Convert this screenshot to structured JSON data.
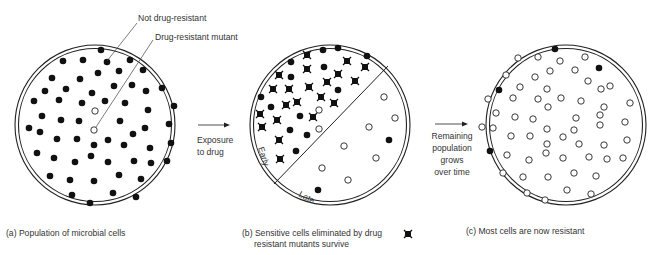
{
  "figure": {
    "callouts": {
      "not_resistant": "Not drug-resistant",
      "resistant_mutant": "Drug-resistant mutant"
    },
    "arrow1_label": [
      "Exposure",
      "to drug"
    ],
    "arrow2_label": [
      "Remaining",
      "population",
      "grows",
      "over time"
    ],
    "zone_labels": {
      "early": "Early",
      "late": "Late"
    },
    "captions": {
      "a": "(a) Population of microbial cells",
      "b_line1": "(b) Sensitive cells eliminated by drug",
      "b_line1_suffix": ";",
      "b_line2": "resistant mutants survive",
      "c": "(c) Most cells are now resistant"
    },
    "legend_icon": "x-marked-cell-icon",
    "colors": {
      "ink": "#111111",
      "line": "#222222",
      "text": "#333333",
      "bg": "#ffffff"
    }
  },
  "panels": {
    "a": {
      "center": [
        95,
        125
      ],
      "r": 80,
      "filled": [
        [
          101,
          50
        ],
        [
          63,
          61
        ],
        [
          83,
          60
        ],
        [
          107,
          62
        ],
        [
          130,
          60
        ],
        [
          52,
          78
        ],
        [
          80,
          79
        ],
        [
          98,
          73
        ],
        [
          119,
          71
        ],
        [
          143,
          70
        ],
        [
          45,
          91
        ],
        [
          66,
          89
        ],
        [
          92,
          93
        ],
        [
          114,
          86
        ],
        [
          132,
          85
        ],
        [
          146,
          91
        ],
        [
          162,
          88
        ],
        [
          34,
          101
        ],
        [
          59,
          100
        ],
        [
          82,
          103
        ],
        [
          105,
          101
        ],
        [
          125,
          103
        ],
        [
          174,
          106
        ],
        [
          42,
          116
        ],
        [
          61,
          120
        ],
        [
          79,
          121
        ],
        [
          148,
          110
        ],
        [
          120,
          121
        ],
        [
          29,
          128
        ],
        [
          40,
          132
        ],
        [
          145,
          128
        ],
        [
          169,
          124
        ],
        [
          57,
          139
        ],
        [
          77,
          139
        ],
        [
          94,
          145
        ],
        [
          108,
          140
        ],
        [
          124,
          145
        ],
        [
          133,
          134
        ],
        [
          150,
          148
        ],
        [
          171,
          143
        ],
        [
          37,
          153
        ],
        [
          54,
          158
        ],
        [
          75,
          162
        ],
        [
          91,
          156
        ],
        [
          108,
          162
        ],
        [
          134,
          161
        ],
        [
          151,
          163
        ],
        [
          167,
          161
        ],
        [
          50,
          176
        ],
        [
          70,
          180
        ],
        [
          94,
          181
        ],
        [
          119,
          175
        ],
        [
          141,
          179
        ],
        [
          72,
          195
        ],
        [
          90,
          203
        ],
        [
          113,
          193
        ],
        [
          136,
          197
        ]
      ],
      "hollow": [
        [
          95,
          111
        ],
        [
          94,
          130
        ]
      ]
    },
    "b": {
      "center": [
        330,
        125
      ],
      "r": 80,
      "divider": [
        [
          388,
          66
        ],
        [
          274,
          184
        ]
      ],
      "killed": [
        [
          307,
          55
        ],
        [
          347,
          61
        ],
        [
          365,
          67
        ],
        [
          307,
          69
        ],
        [
          338,
          74
        ],
        [
          279,
          75
        ],
        [
          327,
          82
        ],
        [
          355,
          81
        ],
        [
          273,
          89
        ],
        [
          289,
          89
        ],
        [
          309,
          87
        ],
        [
          321,
          97
        ],
        [
          297,
          102
        ],
        [
          286,
          105
        ],
        [
          334,
          103
        ],
        [
          260,
          114
        ],
        [
          277,
          120
        ],
        [
          313,
          117
        ],
        [
          262,
          127
        ],
        [
          279,
          140
        ],
        [
          280,
          159
        ]
      ],
      "filled": [
        [
          323,
          50
        ],
        [
          338,
          48
        ],
        [
          367,
          56
        ],
        [
          291,
          62
        ],
        [
          324,
          67
        ],
        [
          291,
          77
        ],
        [
          338,
          90
        ],
        [
          261,
          97
        ],
        [
          271,
          107
        ],
        [
          300,
          116
        ],
        [
          290,
          130
        ],
        [
          307,
          135
        ],
        [
          296,
          151
        ],
        [
          389,
          140
        ],
        [
          318,
          190
        ]
      ],
      "hollow": [
        [
          319,
          110
        ],
        [
          319,
          129
        ],
        [
          384,
          97
        ],
        [
          395,
          118
        ],
        [
          369,
          127
        ],
        [
          344,
          146
        ],
        [
          376,
          158
        ],
        [
          322,
          168
        ],
        [
          348,
          180
        ]
      ],
      "early_pos": [
        258,
        148,
        72
      ],
      "late_pos": [
        298,
        196,
        28
      ]
    },
    "c": {
      "center": [
        566,
        125
      ],
      "r": 80,
      "filled": [
        [
          555,
          49
        ],
        [
          599,
          68
        ],
        [
          499,
          90
        ],
        [
          490,
          151
        ]
      ],
      "hollow": [
        [
          518,
          58
        ],
        [
          538,
          57
        ],
        [
          585,
          57
        ],
        [
          560,
          61
        ],
        [
          506,
          75
        ],
        [
          535,
          77
        ],
        [
          550,
          71
        ],
        [
          575,
          70
        ],
        [
          588,
          81
        ],
        [
          610,
          86
        ],
        [
          520,
          87
        ],
        [
          547,
          89
        ],
        [
          601,
          89
        ],
        [
          488,
          99
        ],
        [
          513,
          98
        ],
        [
          538,
          99
        ],
        [
          561,
          98
        ],
        [
          581,
          101
        ],
        [
          604,
          107
        ],
        [
          630,
          103
        ],
        [
          496,
          113
        ],
        [
          548,
          107
        ],
        [
          515,
          117
        ],
        [
          533,
          119
        ],
        [
          576,
          118
        ],
        [
          600,
          115
        ],
        [
          625,
          122
        ],
        [
          482,
          127
        ],
        [
          493,
          128
        ],
        [
          547,
          129
        ],
        [
          574,
          130
        ],
        [
          600,
          125
        ],
        [
          511,
          136
        ],
        [
          530,
          136
        ],
        [
          547,
          144
        ],
        [
          563,
          137
        ],
        [
          579,
          144
        ],
        [
          604,
          145
        ],
        [
          627,
          140
        ],
        [
          507,
          155
        ],
        [
          529,
          160
        ],
        [
          546,
          153
        ],
        [
          563,
          158
        ],
        [
          589,
          157
        ],
        [
          607,
          159
        ],
        [
          623,
          158
        ],
        [
          503,
          173
        ],
        [
          523,
          177
        ],
        [
          548,
          177
        ],
        [
          574,
          173
        ],
        [
          596,
          176
        ],
        [
          527,
          193
        ],
        [
          545,
          200
        ],
        [
          567,
          190
        ],
        [
          591,
          194
        ]
      ]
    }
  }
}
